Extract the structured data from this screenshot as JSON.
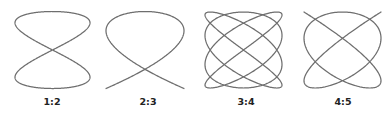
{
  "figure": {
    "stroke_color": "#6e6e6e",
    "label_color": "#222222",
    "background": "#ffffff"
  },
  "figures": [
    {
      "label": "1:2",
      "a": 1,
      "b": 2,
      "cx": 52.5,
      "cy": 50,
      "rx": 37.5,
      "ry": 38.5
    },
    {
      "label": "2:3",
      "a": 2,
      "b": 3,
      "cx": 145,
      "cy": 50,
      "rx": 39,
      "ry": 38.5
    },
    {
      "label": "3:4",
      "a": 3,
      "b": 4,
      "cx": 243.5,
      "cy": 50,
      "rx": 38.5,
      "ry": 38
    },
    {
      "label": "4:5",
      "a": 4,
      "b": 5,
      "cx": 342.5,
      "cy": 50,
      "rx": 38.5,
      "ry": 38
    }
  ],
  "phase_delta": "pi/2"
}
